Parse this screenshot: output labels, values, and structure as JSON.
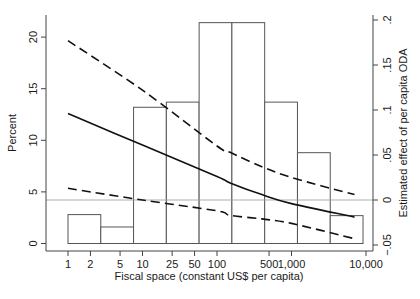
{
  "chart_data": {
    "type": "bar",
    "title": "",
    "xlabel": "Fiscal space (constant US$ per capita)",
    "ylabel_left": "Percent",
    "ylabel_right": "Estimated effect of per capita ODA",
    "x_scale": "log",
    "xlim": [
      1,
      10000
    ],
    "ylim_left": [
      0,
      22
    ],
    "ylim_right": [
      -0.05,
      0.2
    ],
    "x_ticks": [
      {
        "value": 1,
        "label": "1"
      },
      {
        "value": 2,
        "label": "2"
      },
      {
        "value": 5,
        "label": "5"
      },
      {
        "value": 10,
        "label": "10"
      },
      {
        "value": 25,
        "label": "25"
      },
      {
        "value": 50,
        "label": "50"
      },
      {
        "value": 100,
        "label": "100"
      },
      {
        "value": 500,
        "label": "500"
      },
      {
        "value": 1000,
        "label": "1,000"
      },
      {
        "value": 10000,
        "label": "10,000"
      }
    ],
    "y_ticks_left": [
      {
        "value": 0,
        "label": "0"
      },
      {
        "value": 5,
        "label": "5"
      },
      {
        "value": 10,
        "label": "10"
      },
      {
        "value": 15,
        "label": "15"
      },
      {
        "value": 20,
        "label": "20"
      }
    ],
    "y_ticks_right": [
      {
        "value": -0.05,
        "label": "-.05"
      },
      {
        "value": 0,
        "label": "0"
      },
      {
        "value": 0.05,
        "label": ".05"
      },
      {
        "value": 0.1,
        "label": ".1"
      },
      {
        "value": 0.15,
        "label": ".15"
      },
      {
        "value": 0.2,
        "label": ".2"
      }
    ],
    "histogram": {
      "axis": "left",
      "bins_log10": [
        [
          0,
          0.44
        ],
        [
          0.44,
          0.88
        ],
        [
          0.88,
          1.32
        ],
        [
          1.32,
          1.76
        ],
        [
          1.76,
          2.2
        ],
        [
          2.2,
          2.64
        ],
        [
          2.64,
          3.08
        ],
        [
          3.08,
          3.52
        ],
        [
          3.52,
          3.96
        ]
      ],
      "values": [
        2.8,
        1.6,
        13.2,
        13.7,
        21.4,
        21.4,
        13.7,
        8.8,
        2.7
      ]
    },
    "reference_line": {
      "axis": "right",
      "value": 0
    },
    "series": [
      {
        "name": "Estimated effect",
        "style": "solid",
        "axis": "right",
        "x": [
          1,
          10,
          100,
          150,
          400,
          1000,
          7000
        ],
        "values": [
          0.096,
          0.061,
          0.026,
          0.019,
          0.006,
          -0.004,
          -0.019
        ]
      },
      {
        "name": "Upper confidence bound",
        "style": "dashed",
        "axis": "right",
        "x": [
          1,
          10,
          100,
          150,
          400,
          1000,
          7000
        ],
        "values": [
          0.177,
          0.122,
          0.06,
          0.053,
          0.037,
          0.025,
          0.006
        ]
      },
      {
        "name": "Lower confidence bound",
        "style": "dashed",
        "axis": "right",
        "x": [
          1,
          10,
          100,
          150,
          400,
          1000,
          7000
        ],
        "values": [
          0.013,
          0.0,
          -0.012,
          -0.017,
          -0.021,
          -0.026,
          -0.043
        ]
      }
    ],
    "grid": false,
    "legend": "none"
  }
}
